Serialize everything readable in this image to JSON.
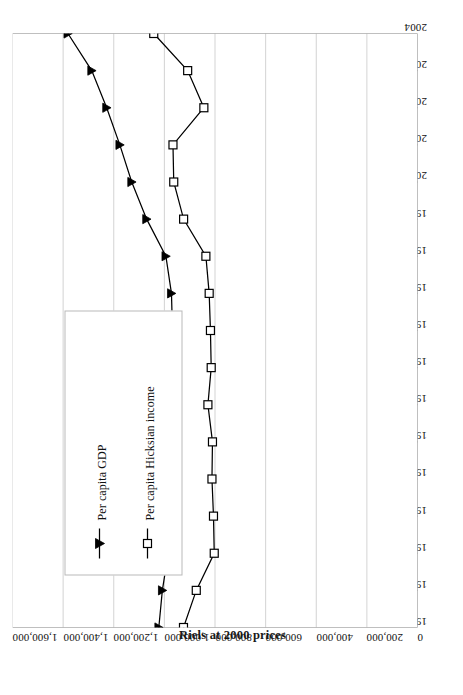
{
  "chart_data": {
    "type": "line",
    "title": "",
    "subtitle": "",
    "xlabel": "",
    "ylabel": "Riels at 2000 prices",
    "orientation": "rotated-90-ccw",
    "grid": "vertical-gridlines-on-value-axis",
    "legend_position": "inside-plot-left",
    "xlim": [
      1988,
      2004
    ],
    "ylim": [
      0,
      1600000
    ],
    "ytick_step": 200000,
    "x": [
      1988,
      1989,
      1990,
      1991,
      1992,
      1993,
      1994,
      1995,
      1996,
      1997,
      1998,
      1999,
      2000,
      2001,
      2002,
      2003,
      2004
    ],
    "xticklabels": [
      "1988",
      "1989",
      "1990",
      "1991",
      "1992",
      "1993",
      "1994",
      "1995",
      "1996",
      "1997",
      "1998",
      "1999",
      "2000",
      "2001",
      "2002",
      "2003",
      "2004"
    ],
    "yticklabels": [
      "0",
      "200,000",
      "400,000",
      "600,000",
      "800,000",
      "1,000,000",
      "1,200,000",
      "1,400,000",
      "1,600,000"
    ],
    "ytickvalues": [
      0,
      200000,
      400000,
      600000,
      800000,
      1000000,
      1200000,
      1400000,
      1600000
    ],
    "series": [
      {
        "name": "Per capita GDP",
        "marker": "filled-triangle",
        "color": "#000000",
        "values": [
          1022000,
          1008000,
          985000,
          972000,
          968000,
          970000,
          963000,
          966000,
          968000,
          972000,
          994000,
          1070000,
          1129000,
          1176000,
          1228000,
          1287000,
          1381000
        ]
      },
      {
        "name": "Per capita Hicksian income",
        "marker": "open-square",
        "color": "#000000",
        "values": [
          924500,
          874000,
          803000,
          806000,
          812000,
          810000,
          828000,
          815000,
          818000,
          823000,
          836000,
          924000,
          963000,
          966000,
          844000,
          908000,
          1042000
        ]
      }
    ]
  },
  "axis": {
    "value_axis_title": "Riels at 2000 prices"
  },
  "legend": {
    "items": [
      {
        "label": "Per capita GDP",
        "marker": "filled-triangle-icon"
      },
      {
        "label": "Per capita Hicksian income",
        "marker": "open-square-icon"
      }
    ]
  }
}
